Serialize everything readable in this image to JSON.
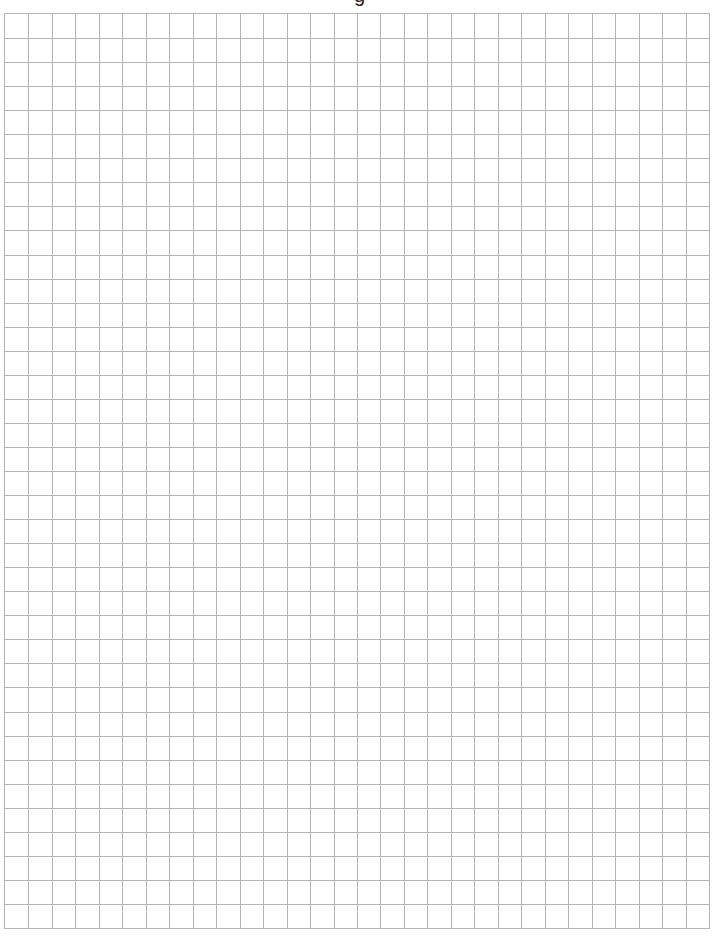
{
  "page": {
    "title_partial": "g",
    "background_color": "#ffffff"
  },
  "grid": {
    "columns": 30,
    "rows": 38,
    "line_color": "#b4b4b4",
    "cell_width_px": 23.5,
    "cell_height_px": 24.1
  }
}
